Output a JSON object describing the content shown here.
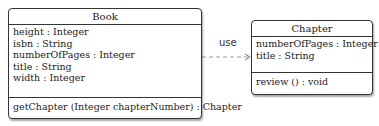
{
  "classes": {
    "book": {
      "name": "Book",
      "attributes": [
        "height  : Integer",
        "isbn  : String",
        "numberOfPages  : Integer",
        "title  : String",
        "width  : Integer"
      ],
      "methods": [
        "getChapter (Integer chapterNumber) : Chapter"
      ]
    },
    "chapter": {
      "name": "Chapter",
      "attributes": [
        "numberOfPages  : Integer",
        "title  : String"
      ],
      "methods": [
        "review () : void"
      ]
    }
  },
  "relations": [
    {
      "from": "Book",
      "to": "Chapter",
      "type": "dependency",
      "label": "use"
    }
  ]
}
